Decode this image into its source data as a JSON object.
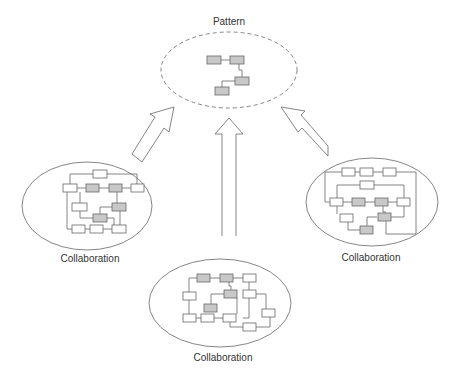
{
  "pattern": {
    "label": "Pattern"
  },
  "collaborations": [
    {
      "id": "left",
      "label": "Collaboration"
    },
    {
      "id": "right",
      "label": "Collaboration"
    },
    {
      "id": "bottom",
      "label": "Collaboration"
    }
  ],
  "colors": {
    "stroke": "#555555",
    "gray_fill": "#c8c8c8",
    "white_fill": "#ffffff",
    "text": "#333333"
  }
}
